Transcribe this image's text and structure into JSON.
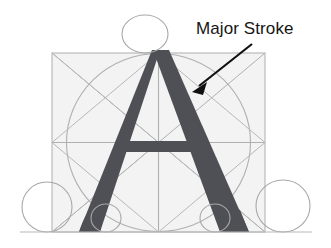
{
  "figure": {
    "name": "letter-a-construction-diagram",
    "background_color": "#ffffff",
    "glyph": {
      "character": "A",
      "fill_color": "#4f5055",
      "label": "capital-letter-a"
    },
    "construction": {
      "square_fill": "#f4f4f4",
      "guide_color": "#b3b3b3",
      "guide_color_dark": "#9a9a9a",
      "square": {
        "x": 52,
        "y": 53,
        "width": 213,
        "height": 179
      },
      "inscribed_circle": {
        "cx": 158.5,
        "cy": 142.5,
        "rx": 92,
        "ry": 89
      },
      "crossbar": {
        "y_top": 141,
        "y_bottom": 152
      },
      "ellipses": [
        {
          "name": "apex-ellipse-top",
          "cx": 145,
          "cy": 34,
          "rx": 23,
          "ry": 19
        },
        {
          "name": "left-foot-ellipse",
          "cx": 47,
          "cy": 207,
          "rx": 25,
          "ry": 25
        },
        {
          "name": "right-foot-ellipse",
          "cx": 283,
          "cy": 206,
          "rx": 27,
          "ry": 26
        },
        {
          "name": "inner-left-circle",
          "cx": 106,
          "cy": 218,
          "rx": 15,
          "ry": 14
        },
        {
          "name": "inner-right-circle",
          "cx": 215,
          "cy": 218,
          "rx": 15,
          "ry": 14
        }
      ]
    },
    "annotation": {
      "label": "Major Stroke",
      "text_color": "#151515",
      "arrow_color": "#101010",
      "arrow": {
        "from_x": 252,
        "from_y": 44,
        "to_x": 193,
        "to_y": 91
      }
    }
  }
}
